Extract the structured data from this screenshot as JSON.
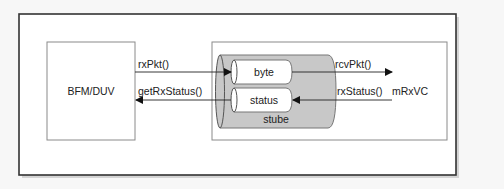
{
  "diagram": {
    "left_block": {
      "label": "BFM/DUV"
    },
    "right_block": {
      "label": "mRxVC"
    },
    "container": {
      "label": "stube"
    },
    "fifos": [
      {
        "label": "byte"
      },
      {
        "label": "status"
      }
    ],
    "arrows": [
      {
        "label": "rxPkt()",
        "from": "BFM/DUV",
        "to": "byte"
      },
      {
        "label": "getRxStatus()",
        "from": "status",
        "to": "BFM/DUV"
      },
      {
        "label": "rcvPkt()",
        "from": "byte",
        "to": "mRxVC"
      },
      {
        "label": "rxStatus()",
        "from": "mRxVC",
        "to": "status"
      }
    ],
    "colors": {
      "frame_border": "#333333",
      "box_border": "#888888",
      "container_fill": "#c8c8c8",
      "fifo_fill": "#ffffff",
      "background": "#ffffff"
    }
  }
}
